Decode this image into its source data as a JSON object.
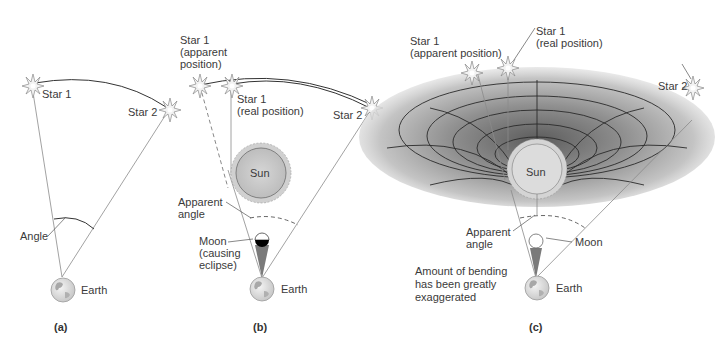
{
  "panels": {
    "a": {
      "caption": "(a)",
      "star1": "Star 1",
      "star2": "Star 2",
      "angle": "Angle",
      "earth": "Earth"
    },
    "b": {
      "caption": "(b)",
      "star1_apparent_line1": "Star 1",
      "star1_apparent_line2": "(apparent",
      "star1_apparent_line3": "position)",
      "star1_real_line1": "Star 1",
      "star1_real_line2": "(real position)",
      "star2": "Star 2",
      "sun": "Sun",
      "apparent_angle_line1": "Apparent",
      "apparent_angle_line2": "angle",
      "moon_line1": "Moon",
      "moon_line2": "(causing",
      "moon_line3": "eclipse)",
      "earth": "Earth"
    },
    "c": {
      "caption": "(c)",
      "star1_apparent_line1": "Star 1",
      "star1_apparent_line2": "(apparent position)",
      "star1_real_line1": "Star 1",
      "star1_real_line2": "(real position)",
      "star2": "Star 2",
      "sun": "Sun",
      "apparent_angle_line1": "Apparent",
      "apparent_angle_line2": "angle",
      "moon": "Moon",
      "note_line1": "Amount of bending",
      "note_line2": "has been greatly",
      "note_line3": "exaggerated",
      "earth": "Earth"
    }
  },
  "colors": {
    "sun_fill": "#c8c8c8",
    "sun_corona": "#d8d8d8",
    "earth_fill": "#e2e2e2",
    "spacetime_dark": "#6e6e6e",
    "spacetime_light": "#e6e6e6",
    "moon_shadow": "#000000",
    "beam": "#7a7a7a"
  }
}
